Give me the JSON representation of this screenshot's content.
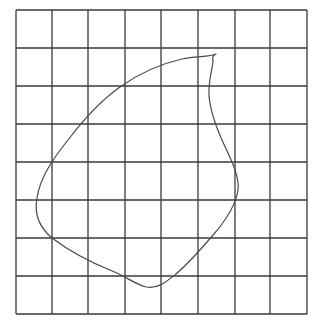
{
  "diagram": {
    "type": "grid-with-closed-curve",
    "grid": {
      "columns": 8,
      "rows": 8,
      "x_lines": [
        16,
        52,
        88,
        125,
        161,
        198,
        235,
        270,
        307
      ],
      "y_lines": [
        10,
        48,
        86,
        124,
        162,
        200,
        238,
        276,
        314
      ],
      "line_color": "#3a3a3a",
      "background": "#ffffff"
    },
    "shape": {
      "kind": "irregular-closed-outline",
      "stroke_color": "#4a4a4a",
      "path": "M216,54 C210,57 196,56 182,59 C160,64 138,74 120,87 C100,101 84,119 68,140 C52,160 40,178 37,198 C34,214 40,228 52,238 C68,250 90,262 110,270 C126,276 134,284 146,287 C158,289 166,282 176,274 C190,262 202,248 214,234 C226,220 236,204 238,190 C240,176 230,158 222,140 C214,122 208,104 209,88 C210,74 213,66 213,60 C212,57 214,55 216,54 Z"
    }
  }
}
